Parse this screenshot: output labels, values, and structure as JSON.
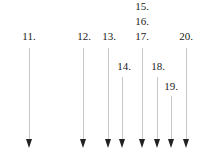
{
  "diagram": {
    "labels": [
      {
        "text": "15.",
        "x": 142,
        "y": 0
      },
      {
        "text": "16.",
        "x": 142,
        "y": 15
      },
      {
        "text": "17.",
        "x": 142,
        "y": 30
      },
      {
        "text": "11.",
        "x": 29,
        "y": 30
      },
      {
        "text": "12.",
        "x": 84,
        "y": 30
      },
      {
        "text": "13.",
        "x": 109,
        "y": 30
      },
      {
        "text": "20.",
        "x": 186,
        "y": 30
      },
      {
        "text": "14.",
        "x": 124,
        "y": 60
      },
      {
        "text": "18.",
        "x": 158,
        "y": 60
      },
      {
        "text": "19.",
        "x": 171,
        "y": 80
      }
    ],
    "arrows": [
      {
        "id": "11",
        "x": 29,
        "top": 48,
        "bottom": 148
      },
      {
        "id": "12",
        "x": 83,
        "top": 48,
        "bottom": 148
      },
      {
        "id": "13",
        "x": 108,
        "top": 48,
        "bottom": 148
      },
      {
        "id": "14",
        "x": 122,
        "top": 77,
        "bottom": 148
      },
      {
        "id": "17",
        "x": 142,
        "top": 48,
        "bottom": 148
      },
      {
        "id": "18",
        "x": 157,
        "top": 77,
        "bottom": 148
      },
      {
        "id": "19",
        "x": 171,
        "top": 96,
        "bottom": 148
      },
      {
        "id": "20",
        "x": 186,
        "top": 48,
        "bottom": 148
      }
    ]
  }
}
